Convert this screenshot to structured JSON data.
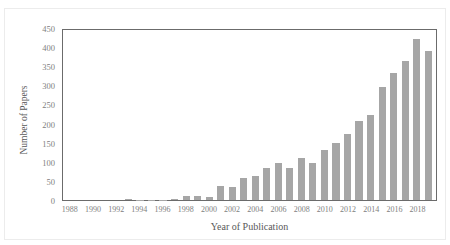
{
  "figure": {
    "top_caption_fragment": "",
    "background_color": "#ffffff",
    "bar_color": "#a6a6a6",
    "axis_color": "#6b6b6b",
    "tick_label_color": "#808080"
  },
  "chart_data": {
    "type": "bar",
    "title": "",
    "xlabel": "Year of Publication",
    "ylabel": "Number of Papers",
    "ylim": [
      0,
      450
    ],
    "ytick_step": 50,
    "yticks": [
      0,
      50,
      100,
      150,
      200,
      250,
      300,
      350,
      400,
      450
    ],
    "ytick_labels": [
      "0",
      "50",
      "100",
      "150",
      "200",
      "250",
      "300",
      "350",
      "400",
      "450"
    ],
    "grid": false,
    "legend": null,
    "xtick_labels": [
      "1988",
      "1990",
      "1992",
      "1994",
      "1996",
      "1998",
      "2000",
      "2002",
      "2004",
      "2006",
      "2008",
      "2010",
      "2012",
      "2014",
      "2016",
      "2018"
    ],
    "xtick_every": 2,
    "categories": [
      "1988",
      "1989",
      "1990",
      "1991",
      "1992",
      "1993",
      "1994",
      "1995",
      "1996",
      "1997",
      "1998",
      "1999",
      "2000",
      "2001",
      "2002",
      "2003",
      "2004",
      "2005",
      "2006",
      "2007",
      "2008",
      "2009",
      "2010",
      "2011",
      "2012",
      "2013",
      "2014",
      "2015",
      "2016",
      "2017",
      "2018",
      "2019"
    ],
    "values": [
      0,
      0,
      0,
      0,
      0,
      3,
      1,
      1,
      1,
      2,
      11,
      10,
      8,
      36,
      35,
      57,
      63,
      85,
      96,
      85,
      111,
      96,
      131,
      149,
      173,
      206,
      223,
      295,
      332,
      364,
      420,
      390
    ]
  }
}
